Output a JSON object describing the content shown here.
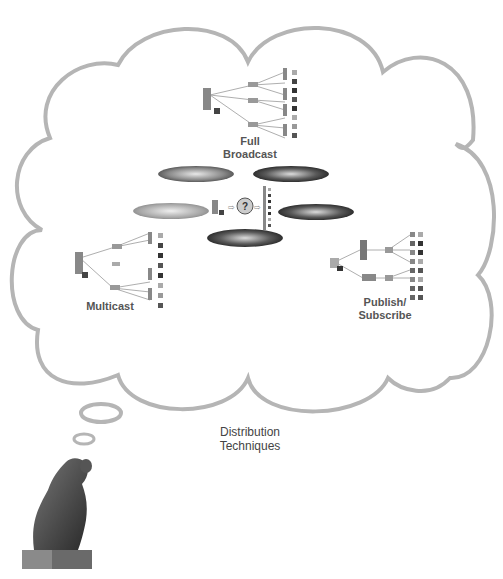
{
  "diagram": {
    "title": "Distribution Techniques",
    "title_lines": [
      "Distribution",
      "Techniques"
    ],
    "techniques": [
      {
        "id": "full-broadcast",
        "lines": [
          "Full",
          "Broadcast"
        ]
      },
      {
        "id": "multicast",
        "lines": [
          "Multicast"
        ]
      },
      {
        "id": "publish-subscribe",
        "lines": [
          "Publish/",
          "Subscribe"
        ]
      }
    ],
    "center": {
      "question_symbol": "?",
      "arrow_symbol": "→"
    },
    "colors": {
      "thought_cloud_stroke": "#b5b5b5",
      "label_text": "#555555",
      "background": "#ffffff"
    },
    "figure": "thinker-statue"
  }
}
